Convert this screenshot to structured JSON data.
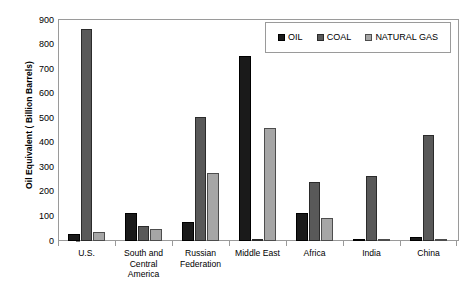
{
  "chart_data": {
    "type": "bar",
    "title": "",
    "subtitle": "",
    "xlabel": "",
    "ylabel": "Oil Equivalent ( Billion Barrels)",
    "ylim": [
      0,
      900
    ],
    "ytick_labels": [
      "900",
      "800",
      "700",
      "600",
      "500",
      "400",
      "300",
      "200",
      "100",
      "0"
    ],
    "ytick_values": [
      900,
      800,
      700,
      600,
      500,
      400,
      300,
      200,
      100,
      0
    ],
    "grid": false,
    "legend_position": "top-right",
    "categories": [
      "U.S.",
      "South and Central America",
      "Russian Federation",
      "Middle East",
      "Africa",
      "India",
      "China"
    ],
    "category_label_lines": [
      [
        "U.S."
      ],
      [
        "South and",
        "Central",
        "America"
      ],
      [
        "Russian",
        "Federation"
      ],
      [
        "Middle East"
      ],
      [
        "Africa"
      ],
      [
        "India"
      ],
      [
        "China"
      ]
    ],
    "series": [
      {
        "name": "OIL",
        "color": "#1a1a1a",
        "values": [
          30,
          115,
          78,
          755,
          115,
          8,
          15
        ]
      },
      {
        "name": "COAL",
        "color": "#595959",
        "values": [
          865,
          60,
          505,
          3,
          242,
          265,
          430
        ]
      },
      {
        "name": "NATURAL GAS",
        "color": "#a6a6a6",
        "values": [
          38,
          50,
          278,
          460,
          92,
          7,
          5
        ]
      }
    ]
  },
  "legend": {
    "entries": [
      {
        "label": "OIL",
        "color": "#1a1a1a"
      },
      {
        "label": "COAL",
        "color": "#595959"
      },
      {
        "label": "NATURAL GAS",
        "color": "#a6a6a6"
      }
    ]
  },
  "colors": {
    "oil": "#1a1a1a",
    "coal": "#595959",
    "natural_gas": "#a6a6a6",
    "axis": "#9a9a9a",
    "text": "#000000",
    "background": "#ffffff"
  }
}
